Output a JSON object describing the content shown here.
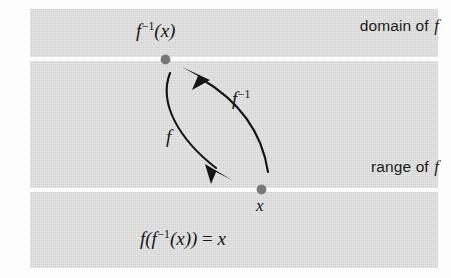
{
  "figure": {
    "caption_equation": "f(f−1(x)) = x",
    "background_color": "#ffffff",
    "band_color": "#d6d6d6",
    "divider_color": "#ffffff",
    "ink_color": "#141414",
    "dot_color": "#777777"
  },
  "bands": {
    "domain": {
      "label_prefix": "domain of ",
      "label_symbol": "f"
    },
    "range": {
      "label_prefix": "range of ",
      "label_symbol": "f"
    }
  },
  "points": {
    "upper": {
      "base": "f",
      "exponent": "−1",
      "argument": "(x)"
    },
    "lower": {
      "label": "x"
    }
  },
  "arrows": {
    "forward": {
      "label_base": "f",
      "direction": "down",
      "from": "f−1(x)",
      "to": "x"
    },
    "inverse": {
      "label_base": "f",
      "label_exponent": "−1",
      "direction": "up",
      "from": "x",
      "to": "f−1(x)"
    }
  },
  "equation": {
    "outer_f": "f(",
    "inner_f": "f",
    "inner_exponent": "−1",
    "inner_arg": "(x)",
    "close": ")",
    "equals": " = ",
    "rhs": "x"
  }
}
